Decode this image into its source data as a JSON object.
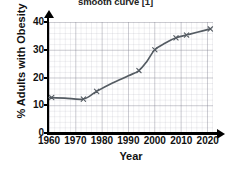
{
  "caption": {
    "text": "smooth curve [1]"
  },
  "chart_data": {
    "type": "line",
    "title": "",
    "xlabel": "Year",
    "ylabel": "% Adults with Obesity",
    "xlim": [
      1960,
      2022
    ],
    "ylim": [
      0,
      40
    ],
    "xticks": [
      1960,
      1970,
      1980,
      1990,
      2000,
      2010,
      2020
    ],
    "xtick_labels": [
      "1960",
      "1970",
      "1980",
      "1990",
      "2000",
      "2010",
      "2020"
    ],
    "yticks": [
      0,
      10,
      20,
      30,
      40
    ],
    "ytick_labels": [
      "0",
      "10",
      "20",
      "30",
      "40"
    ],
    "grid": true,
    "grid_style": "graph-paper",
    "legend": "none",
    "marker": "x",
    "line_color": "#555c63",
    "marker_color": "#555c63",
    "series": [
      {
        "name": "% Adults with Obesity",
        "x": [
          1961,
          1973,
          1978,
          1994,
          2000,
          2008,
          2012,
          2021
        ],
        "values": [
          12.8,
          12.2,
          15.0,
          22.5,
          30.0,
          34.3,
          35.3,
          37.5
        ]
      }
    ],
    "curve_points": [
      {
        "x": 1960,
        "y": 12.8
      },
      {
        "x": 1966,
        "y": 12.6
      },
      {
        "x": 1973,
        "y": 12.2
      },
      {
        "x": 1978,
        "y": 15.0
      },
      {
        "x": 1984,
        "y": 18.0
      },
      {
        "x": 1990,
        "y": 20.6
      },
      {
        "x": 1994,
        "y": 22.5
      },
      {
        "x": 1997,
        "y": 25.8
      },
      {
        "x": 2000,
        "y": 30.0
      },
      {
        "x": 2004,
        "y": 32.4
      },
      {
        "x": 2008,
        "y": 34.3
      },
      {
        "x": 2012,
        "y": 35.3
      },
      {
        "x": 2016,
        "y": 36.3
      },
      {
        "x": 2021,
        "y": 37.5
      }
    ]
  }
}
